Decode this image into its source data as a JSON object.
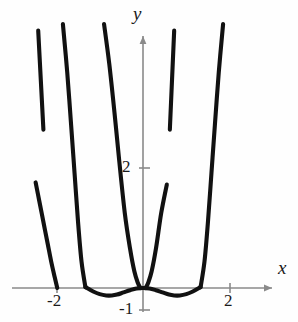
{
  "chart_data": {
    "type": "line",
    "title": "",
    "xlabel": "x",
    "ylabel": "y",
    "xlim": [
      -2.85,
      3.0
    ],
    "ylim": [
      -1.3,
      6.0
    ],
    "grid": false,
    "legend": null,
    "axes_style": "two-axis-cross-with-arrows",
    "x_ticks": [
      -2,
      2
    ],
    "x_tick_labels": [
      "-2",
      "2"
    ],
    "y_ticks": [
      2,
      -1
    ],
    "y_tick_labels": [
      "2",
      "-1"
    ],
    "curve_color": "#111111",
    "axis_color": "#8a8a8a",
    "series": [
      {
        "name": "central-w-segment",
        "comment": "W shape: local max at x=0 y=0, minima near x=+/-0.6 at y=-0.16, rising steeply to y=2.3 at x=+/-0.55 inner walls",
        "x": [
          -1.33,
          -1.15,
          -1.0,
          -0.85,
          -0.72,
          -0.6,
          -0.45,
          -0.3,
          -0.15,
          0.0,
          0.15,
          0.3,
          0.45,
          0.6,
          0.72,
          0.85,
          1.0,
          1.15,
          1.33
        ],
        "y": [
          0.02,
          -0.08,
          -0.14,
          -0.17,
          -0.17,
          -0.15,
          -0.1,
          -0.05,
          -0.01,
          0.0,
          -0.01,
          -0.05,
          -0.1,
          -0.15,
          -0.17,
          -0.17,
          -0.14,
          -0.08,
          0.02
        ]
      },
      {
        "name": "inner-left-wall",
        "comment": "steep branch from near origin up beyond top of frame",
        "x": [
          -0.06,
          -0.12,
          -0.2,
          -0.3,
          -0.42,
          -0.55,
          -0.66,
          -0.78,
          -0.9
        ],
        "y": [
          0.0,
          0.12,
          0.38,
          0.9,
          1.7,
          2.9,
          4.0,
          5.1,
          6.0
        ]
      },
      {
        "name": "inner-right-wall",
        "x": [
          0.06,
          0.12,
          0.2,
          0.3,
          0.42,
          0.55
        ],
        "y": [
          0.0,
          0.12,
          0.38,
          0.9,
          1.7,
          2.35
        ]
      },
      {
        "name": "outer-left-branch",
        "comment": "U branch near x=-1.5 climbing off the top of the frame",
        "x": [
          -1.33,
          -1.42,
          -1.5,
          -1.58,
          -1.66,
          -1.75,
          -1.85
        ],
        "y": [
          0.02,
          0.6,
          1.5,
          2.6,
          3.7,
          4.9,
          6.0
        ]
      },
      {
        "name": "outer-right-branch",
        "x": [
          1.33,
          1.42,
          1.5,
          1.58,
          1.66,
          1.75,
          1.85
        ],
        "y": [
          0.02,
          0.6,
          1.5,
          2.6,
          3.7,
          4.9,
          6.0
        ]
      },
      {
        "name": "isolated-left-arc",
        "comment": "detached arc descending to the x-axis at about x=-2",
        "x": [
          -2.48,
          -2.4,
          -2.3,
          -2.2,
          -2.12,
          -2.04,
          -1.98
        ],
        "y": [
          2.4,
          2.0,
          1.5,
          1.0,
          0.6,
          0.25,
          0.0
        ]
      },
      {
        "name": "isolated-upper-far-left-segment",
        "comment": "detached near-straight steep stroke, upper left",
        "x": [
          -2.42,
          -2.3
        ],
        "y": [
          5.85,
          3.6
        ]
      },
      {
        "name": "isolated-upper-right-segment",
        "comment": "detached near-straight steep stroke, upper right mirror",
        "x": [
          0.72,
          0.62
        ],
        "y": [
          5.85,
          3.6
        ]
      }
    ]
  },
  "labels": {
    "y_axis": "y",
    "x_axis": "x",
    "x_neg2": "-2",
    "x_pos2": "2",
    "y_pos2": "2",
    "y_neg1": "-1"
  }
}
